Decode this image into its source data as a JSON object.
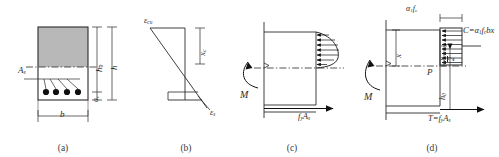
{
  "figure": {
    "stroke_color": "#2a2a2a",
    "concrete_fill": "#b8b8b8",
    "rebar_color": "#101010"
  },
  "panels": [
    {
      "id": "a",
      "caption": "(a)",
      "name": "cross-section",
      "labels": {
        "steel_area": "A",
        "steel_area_sub": "s",
        "effective_depth": "h",
        "effective_depth_sub": "0",
        "total_depth": "h",
        "cover": "a",
        "cover_sub": "s",
        "width": "b"
      },
      "rebar_count": 4
    },
    {
      "id": "b",
      "caption": "(b)",
      "name": "strain-distribution",
      "labels": {
        "concrete_strain": "ε",
        "concrete_strain_sub": "cu",
        "steel_strain": "ε",
        "steel_strain_sub": "s",
        "neutral_axis_depth": "x",
        "neutral_axis_sub": "c"
      }
    },
    {
      "id": "c",
      "caption": "(c)",
      "name": "actual-stress-distribution",
      "labels": {
        "moment": "M",
        "tension_force": "f",
        "tension_force_sub1": "y",
        "tension_force_rest": "A",
        "tension_force_sub2": "s"
      }
    },
    {
      "id": "d",
      "caption": "(d)",
      "name": "equivalent-stress-block",
      "labels": {
        "moment": "M",
        "block_depth": "x",
        "concrete_stress": "α",
        "concrete_stress_sub1": "1",
        "concrete_stress_f": "f",
        "concrete_stress_sub2": "c",
        "compression": "C=α",
        "compression_sub1": "1",
        "compression_f": "f",
        "compression_sub2": "c",
        "compression_rest": "bx",
        "point_p": "P",
        "half_depth_num": "x",
        "half_depth_den": "2",
        "lever_arm": "h",
        "lever_arm_sub": "0",
        "tension": "T=f",
        "tension_sub1": "y",
        "tension_rest": "A",
        "tension_sub2": "s"
      }
    }
  ]
}
